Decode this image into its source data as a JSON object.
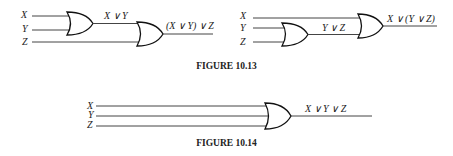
{
  "figures": [
    {
      "id": "fig-10-13",
      "caption": "FIGURE 10.13",
      "left_circuit": {
        "inputs": [
          "X",
          "Y",
          "Z"
        ],
        "intermediate_label": "X ∨ Y",
        "output_label": "(X ∨ Y) ∨ Z"
      },
      "right_circuit": {
        "inputs": [
          "X",
          "Y",
          "Z"
        ],
        "intermediate_label": "Y ∨ Z",
        "output_label": "X ∨ (Y ∨ Z)"
      }
    },
    {
      "id": "fig-10-14",
      "caption": "FIGURE 10.14",
      "circuit": {
        "inputs": [
          "X",
          "Y",
          "Z"
        ],
        "output_label": "X ∨ Y ∨ Z"
      }
    }
  ],
  "colors": {
    "line": "#444444",
    "text": "#222222",
    "background": "#ffffff"
  }
}
